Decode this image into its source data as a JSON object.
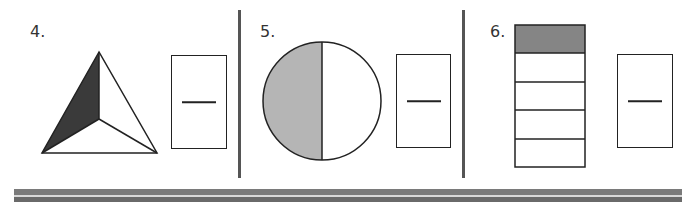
{
  "problems": [
    {
      "number": "4.",
      "shape": "triangle",
      "parts": 3,
      "shaded": 1,
      "shade_color": "#3a3a3a",
      "answer_line": "—"
    },
    {
      "number": "5.",
      "shape": "circle",
      "parts": 2,
      "shaded": 1,
      "shade_color": "#b5b5b5",
      "answer_line": "—"
    },
    {
      "number": "6.",
      "shape": "rectangle",
      "parts": 5,
      "shaded": 1,
      "shade_color": "#858585",
      "answer_line": "—"
    }
  ],
  "colors": {
    "outline": "#222222",
    "divider": "#555555",
    "footer_bar": "#7a7a7a"
  }
}
